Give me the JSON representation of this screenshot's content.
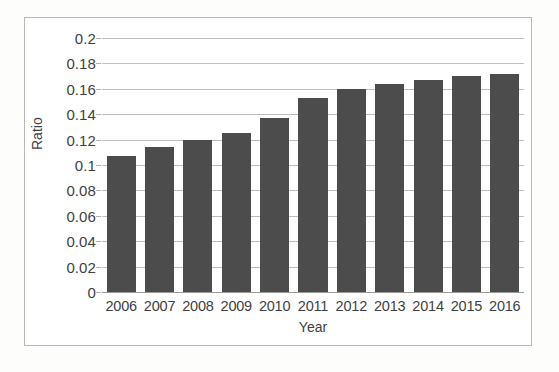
{
  "chart_data": {
    "type": "bar",
    "title": "",
    "subtitle": "",
    "xlabel": "Year",
    "ylabel": "Ratio",
    "categories": [
      "2006",
      "2007",
      "2008",
      "2009",
      "2010",
      "2011",
      "2012",
      "2013",
      "2014",
      "2015",
      "2016"
    ],
    "values": [
      0.107,
      0.114,
      0.12,
      0.125,
      0.137,
      0.153,
      0.16,
      0.164,
      0.167,
      0.17,
      0.172
    ],
    "series": [
      {
        "name": "Ratio",
        "values": [
          0.107,
          0.114,
          0.12,
          0.125,
          0.137,
          0.153,
          0.16,
          0.164,
          0.167,
          0.17,
          0.172
        ]
      }
    ],
    "ylim": [
      0,
      0.2
    ],
    "ytick_values": [
      0.2,
      0.18,
      0.16,
      0.14,
      0.12,
      0.1,
      0.08,
      0.06,
      0.04,
      0.02,
      0
    ],
    "ytick_labels": [
      "0.2",
      "0.18",
      "0.16",
      "0.14",
      "0.12",
      "0.1",
      "0.08",
      "0.06",
      "0.04",
      "0.02",
      "0"
    ],
    "ytick_step": 0.02,
    "grid": "horizontal",
    "legend": "none",
    "legend_position": "none",
    "bar_color": "#4c4c4c",
    "gridline_color": "#bdbdba",
    "plot_background": "#ffffff",
    "frame_border_color": "#b9b9b6",
    "annotations": []
  }
}
